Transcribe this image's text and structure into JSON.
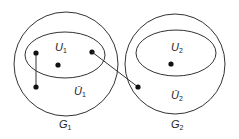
{
  "graphs": [
    {
      "id": "G1",
      "label": "G",
      "sub": "1",
      "subset_label": "U",
      "subset_sub": "1",
      "complement_label": "Ū",
      "complement_sub": "1"
    },
    {
      "id": "G2",
      "label": "G",
      "sub": "2",
      "subset_label": "U",
      "subset_sub": "2",
      "complement_label": "Ū",
      "complement_sub": "2"
    }
  ],
  "colors": {
    "stroke": "#333333",
    "dot": "#111111",
    "background": "#ffffff"
  }
}
